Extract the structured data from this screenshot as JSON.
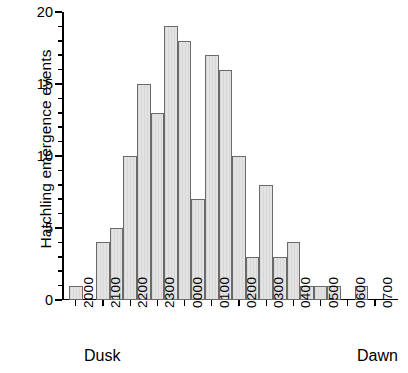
{
  "chart_data": {
    "type": "bar",
    "title": "",
    "xlabel": "",
    "ylabel": "Hatchling emergence events",
    "ylim": [
      0,
      20
    ],
    "ytick_labels": [
      "0",
      "5",
      "10",
      "15",
      "20"
    ],
    "ytick_values": [
      0,
      5,
      10,
      15,
      20
    ],
    "yminor_step": 1,
    "grid": false,
    "legend": null,
    "bin_width_minutes": 30,
    "categories": [
      "2000",
      "2030",
      "2100",
      "2130",
      "2200",
      "2230",
      "2300",
      "2330",
      "0000",
      "0030",
      "0100",
      "0130",
      "0200",
      "0230",
      "0300",
      "0330",
      "0400",
      "0430",
      "0500",
      "0530",
      "0600",
      "0630"
    ],
    "values": [
      1,
      0,
      4,
      5,
      10,
      15,
      13,
      19,
      18,
      7,
      17,
      16,
      10,
      3,
      8,
      3,
      4,
      1,
      1,
      1,
      0,
      1
    ],
    "xtick_labels": [
      "2000",
      "2100",
      "2200",
      "2300",
      "0000",
      "0100",
      "0200",
      "0300",
      "0400",
      "0500",
      "0600",
      "0700"
    ],
    "annotations": [
      {
        "text": "Dusk",
        "position": "left"
      },
      {
        "text": "Dawn",
        "position": "right"
      }
    ],
    "colors": {
      "bar_fill": "#e3e3e3",
      "bar_edge": "#6a6a6a",
      "axis": "#000000",
      "background": "#ffffff"
    }
  }
}
